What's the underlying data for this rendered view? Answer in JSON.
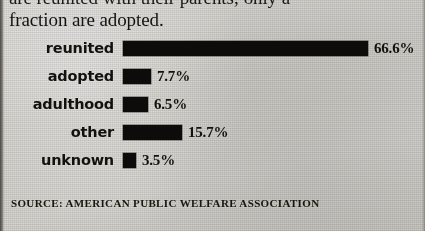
{
  "intro": {
    "line_clipped": "are reunited with their parents; only a",
    "line_visible": "fraction are adopted."
  },
  "source": {
    "credit": "SOURCE: AMERICAN PUBLIC WELFARE ASSOCIATION"
  },
  "chart_data": {
    "type": "bar",
    "orientation": "horizontal",
    "title": "",
    "xlabel": "",
    "ylabel": "",
    "categories": [
      "reunited",
      "adopted",
      "adulthood",
      "other",
      "unknown"
    ],
    "values": [
      66.6,
      7.7,
      6.5,
      15.7,
      3.5
    ],
    "value_labels": [
      "66.6%",
      "7.7%",
      "6.5%",
      "15.7%",
      "3.5%"
    ],
    "xlim": [
      0,
      66.6
    ],
    "grid": false,
    "legend": false,
    "bar_color": "#0d0c0a",
    "background_color": "#cfcdc8",
    "bars": [
      {
        "label": "reunited",
        "value": 66.6,
        "value_label": "66.6%",
        "width_px": 245,
        "value_x_px": 374
      },
      {
        "label": "adopted",
        "value": 7.7,
        "value_label": "7.7%",
        "width_px": 28,
        "value_x_px": 157
      },
      {
        "label": "adulthood",
        "value": 6.5,
        "value_label": "6.5%",
        "width_px": 25,
        "value_x_px": 154
      },
      {
        "label": "other",
        "value": 15.7,
        "value_label": "15.7%",
        "width_px": 59,
        "value_x_px": 188
      },
      {
        "label": "unknown",
        "value": 3.5,
        "value_label": "3.5%",
        "width_px": 13,
        "value_x_px": 142
      }
    ]
  }
}
